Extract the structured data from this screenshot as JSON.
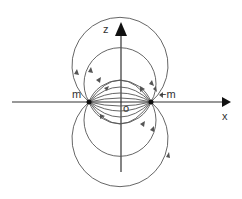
{
  "diagram": {
    "labels": {
      "z_axis": "z",
      "x_axis": "x",
      "origin": "o",
      "pole_left": "m",
      "pole_right": "−m"
    },
    "colors": {
      "line": "#555555",
      "axis": "#222222"
    }
  }
}
